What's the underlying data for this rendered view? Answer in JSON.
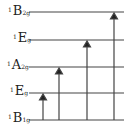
{
  "diagram": {
    "levels": [
      {
        "label_sup": "1",
        "label_main": "B",
        "label_sub": "2g",
        "y": 12
      },
      {
        "label_sup": "1",
        "label_main": "E",
        "label_sub": "g",
        "y": 40
      },
      {
        "label_sup": "1",
        "label_main": "A",
        "label_sub": "2g",
        "y": 67
      },
      {
        "label_sup": "1",
        "label_main": "E",
        "label_sub": "g",
        "y": 93
      },
      {
        "label_sup": "1",
        "label_main": "B",
        "label_sub": "1g",
        "y": 120
      }
    ],
    "transitions": [
      {
        "from": "1B1g",
        "to": "1Eg",
        "x": 43
      },
      {
        "from": "1B1g",
        "to": "1A2g",
        "x": 59
      },
      {
        "from": "1B1g",
        "to": "1Eg (upper)",
        "x": 87
      },
      {
        "from": "1B1g",
        "to": "1B2g",
        "x": 114
      }
    ],
    "colors": {
      "line": "#333333",
      "background": "#ffffff"
    }
  }
}
